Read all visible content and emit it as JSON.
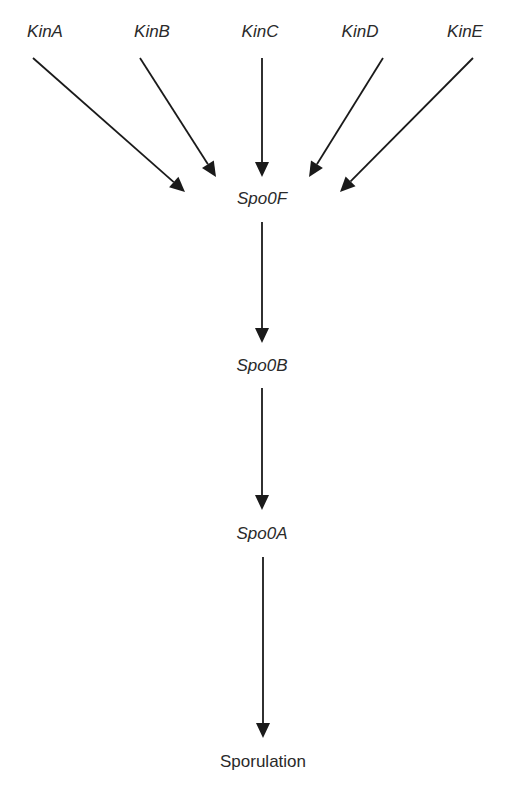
{
  "diagram": {
    "type": "signaling-pathway",
    "nodes": [
      {
        "id": "kinA",
        "label": "KinA",
        "italic": true,
        "x": 45,
        "y": 22
      },
      {
        "id": "kinB",
        "label": "KinB",
        "italic": true,
        "x": 152,
        "y": 22
      },
      {
        "id": "kinC",
        "label": "KinC",
        "italic": true,
        "x": 260,
        "y": 22
      },
      {
        "id": "kinD",
        "label": "KinD",
        "italic": true,
        "x": 360,
        "y": 22
      },
      {
        "id": "kinE",
        "label": "KinE",
        "italic": true,
        "x": 465,
        "y": 22
      },
      {
        "id": "spo0F",
        "label": "Spo0F",
        "italic": true,
        "x": 262,
        "y": 189
      },
      {
        "id": "spo0B",
        "label": "Spo0B",
        "italic": true,
        "x": 262,
        "y": 356
      },
      {
        "id": "spo0A",
        "label": "Spo0A",
        "italic": true,
        "x": 262,
        "y": 524
      },
      {
        "id": "sporulation",
        "label": "Sporulation",
        "italic": false,
        "x": 263,
        "y": 752
      }
    ],
    "edges": [
      {
        "from": "kinA",
        "to": "spo0F",
        "x1": 33,
        "y1": 58,
        "x2": 185,
        "y2": 192
      },
      {
        "from": "kinB",
        "to": "spo0F",
        "x1": 140,
        "y1": 58,
        "x2": 216,
        "y2": 177
      },
      {
        "from": "kinC",
        "to": "spo0F",
        "x1": 262,
        "y1": 58,
        "x2": 262,
        "y2": 177
      },
      {
        "from": "kinD",
        "to": "spo0F",
        "x1": 383,
        "y1": 58,
        "x2": 309,
        "y2": 177
      },
      {
        "from": "kinE",
        "to": "spo0F",
        "x1": 473,
        "y1": 58,
        "x2": 340,
        "y2": 192
      },
      {
        "from": "spo0F",
        "to": "spo0B",
        "x1": 262,
        "y1": 222,
        "x2": 262,
        "y2": 343
      },
      {
        "from": "spo0B",
        "to": "spo0A",
        "x1": 262,
        "y1": 388,
        "x2": 262,
        "y2": 510
      },
      {
        "from": "spo0A",
        "to": "sporulation",
        "x1": 263,
        "y1": 557,
        "x2": 263,
        "y2": 738
      }
    ],
    "colors": {
      "line": "#1a1a1a",
      "text": "#2a2a2a",
      "background": "#ffffff"
    }
  }
}
